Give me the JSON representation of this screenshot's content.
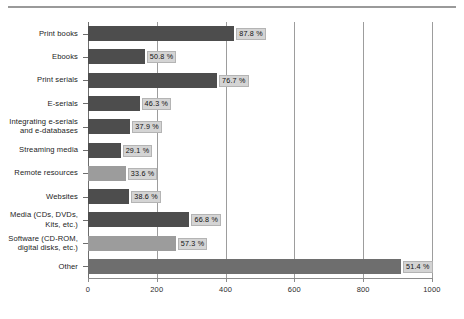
{
  "chart_data": {
    "type": "bar",
    "orientation": "horizontal",
    "title": "",
    "xlabel": "",
    "ylabel": "",
    "xlim": [
      0,
      1000
    ],
    "xticks": [
      0,
      200,
      400,
      600,
      800,
      1000
    ],
    "xticklabels": [
      "0",
      "200",
      "400",
      "600",
      "800",
      "1000"
    ],
    "grid": "vertical",
    "legend": "none",
    "categories": [
      "Print books",
      "Ebooks",
      "Print serials",
      "E-serials",
      "Integrating e-serials\nand e-databases",
      "Streaming media",
      "Remote resources",
      "Websites",
      "Media (CDs, DVDs,\nKits, etc.)",
      "Software (CD-ROM,\ndigital disks, etc.)",
      "Other"
    ],
    "values": [
      425,
      165,
      375,
      150,
      123,
      95,
      110,
      120,
      295,
      255,
      910
    ],
    "data_labels": [
      "87.8 %",
      "50.8 %",
      "76.7 %",
      "46.3 %",
      "37.9 %",
      "29.1 %",
      "33.6 %",
      "38.6 %",
      "66.8 %",
      "57.3 %",
      "51.4 %"
    ],
    "bar_shades": [
      "dark",
      "dark",
      "dark",
      "dark",
      "dark",
      "dark",
      "light",
      "dark",
      "dark",
      "light",
      "mid"
    ],
    "colors": {
      "bar_dark": "#4d4d4d",
      "bar_light": "#9c9c9c",
      "bar_mid": "#6e6e6e",
      "label_background": "#d4d4d4",
      "axis": "#6d6d6d",
      "gridline": "#9d9d9d",
      "background": "#ffffff"
    }
  }
}
